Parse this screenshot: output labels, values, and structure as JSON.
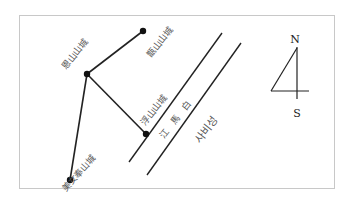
{
  "diagram": {
    "frame": {
      "x": 19,
      "y": 15,
      "width": 315,
      "height": 173,
      "stroke": "#bbbbbb"
    },
    "fortresses": [
      {
        "id": "top",
        "label": "甑山山城",
        "x": 143,
        "y": 31
      },
      {
        "id": "middle",
        "label": "恩山山城",
        "x": 87,
        "y": 74
      },
      {
        "id": "lower",
        "label": "浮山山城",
        "x": 146,
        "y": 134
      },
      {
        "id": "bottom",
        "label": "美女奉山城",
        "x": 70,
        "y": 180
      }
    ],
    "river": {
      "name": "江 馬 白",
      "banks": [
        {
          "x1": 222,
          "y1": 33,
          "x2": 129,
          "y2": 162
        },
        {
          "x1": 241,
          "y1": 43,
          "x2": 147,
          "y2": 175
        }
      ]
    },
    "city_label": "사비성",
    "compass": {
      "north": "N",
      "south": "S"
    },
    "line_color": "#222222"
  }
}
